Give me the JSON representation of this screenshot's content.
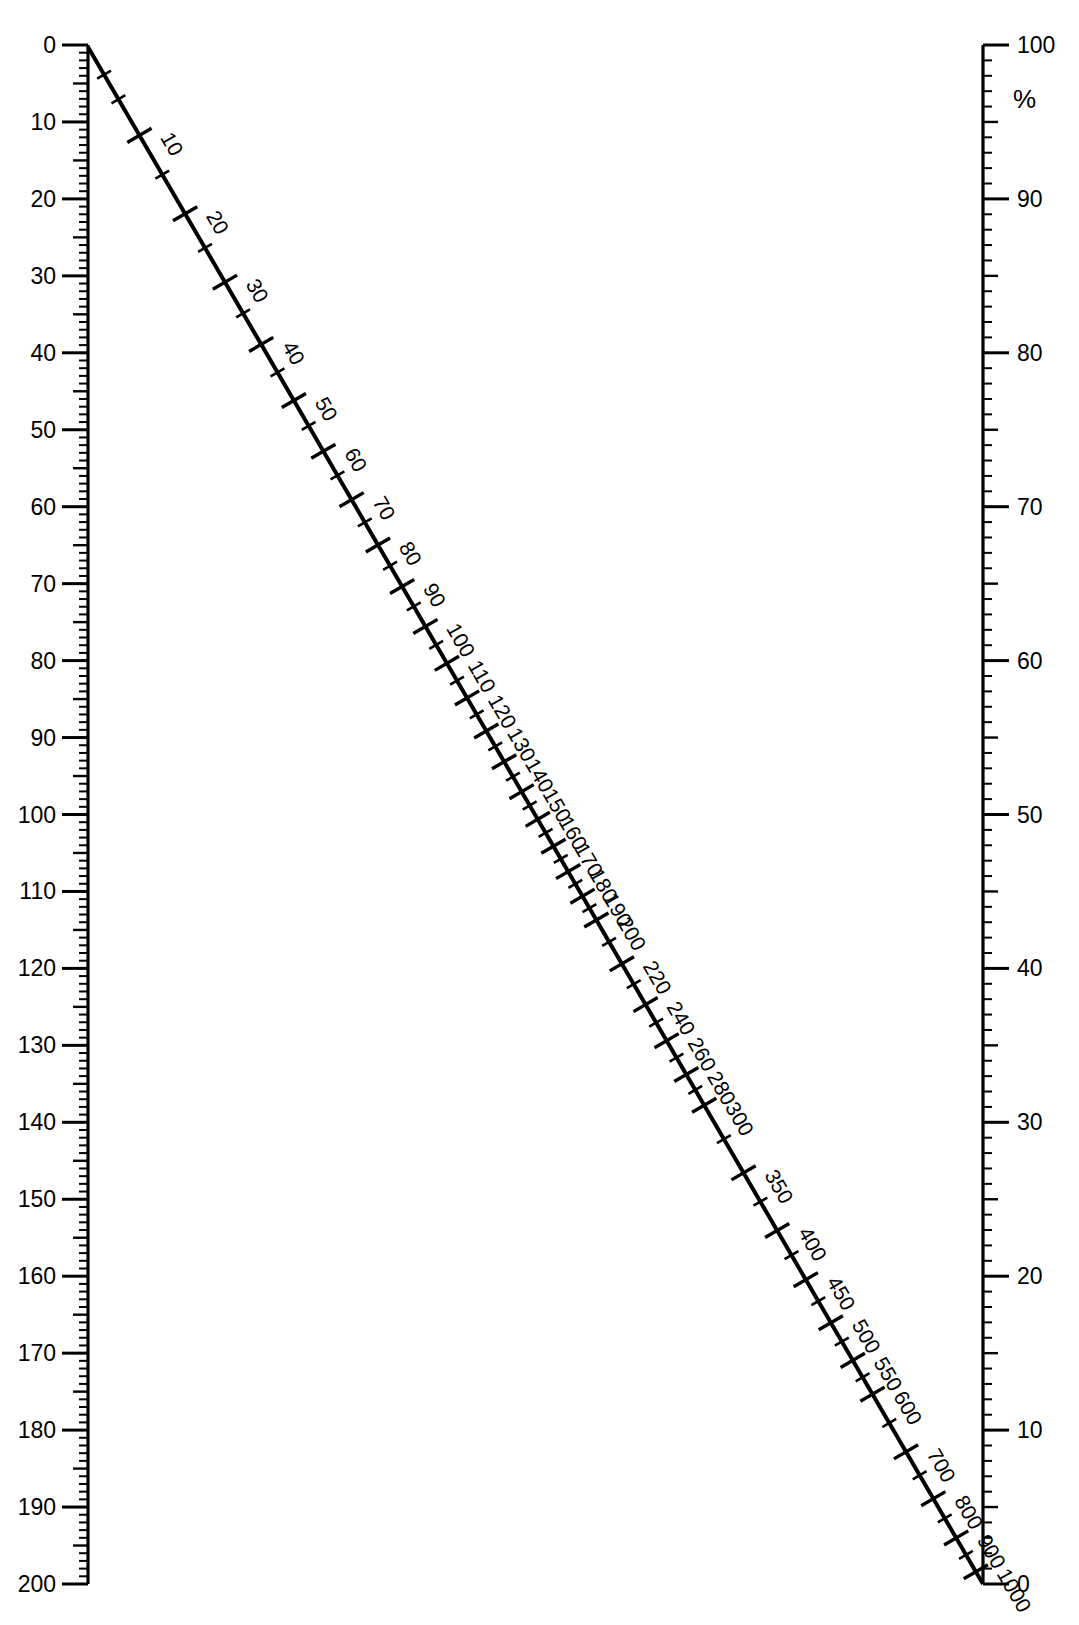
{
  "figure": {
    "type": "nomogram",
    "title_fragment": "",
    "background": "#ffffff",
    "ink_color": "#000000"
  },
  "chart_data": {
    "type": "line",
    "title": "",
    "subtitle": "",
    "xlabel": "",
    "ylabel": "",
    "grid": false,
    "legend": "none",
    "axes": [
      {
        "name": "left-axis",
        "position": "left",
        "orientation": "vertical",
        "direction": "top-to-bottom",
        "range": [
          0,
          200
        ],
        "min": 0,
        "max": 200,
        "major_step": 10,
        "medium_step": 5,
        "minor_step": 1,
        "unit": "",
        "tick_side": "left",
        "major_ticks": [
          0,
          10,
          20,
          30,
          40,
          50,
          60,
          70,
          80,
          90,
          100,
          110,
          120,
          130,
          140,
          150,
          160,
          170,
          180,
          190,
          200
        ],
        "tick_labels": [
          "0",
          "10",
          "20",
          "30",
          "40",
          "50",
          "60",
          "70",
          "80",
          "90",
          "100",
          "110",
          "120",
          "130",
          "140",
          "150",
          "160",
          "170",
          "180",
          "190",
          "200"
        ]
      },
      {
        "name": "right-axis",
        "position": "right",
        "orientation": "vertical",
        "direction": "top-to-bottom",
        "range": [
          100,
          0
        ],
        "min": 0,
        "max": 100,
        "major_step": 10,
        "medium_step": 5,
        "minor_step": 1,
        "unit": "%",
        "unit_label": "%",
        "tick_side": "right",
        "major_ticks": [
          100,
          90,
          80,
          70,
          60,
          50,
          40,
          30,
          20,
          10,
          0
        ],
        "tick_labels": [
          "100",
          "90",
          "80",
          "70",
          "60",
          "50",
          "40",
          "30",
          "20",
          "10",
          "0"
        ]
      }
    ],
    "series": [
      {
        "name": "diagonal-scale-line",
        "kind": "straight-line-with-scale",
        "from": {
          "left_axis_value": 0,
          "right_axis_value": 100
        },
        "to": {
          "left_axis_value": 200,
          "right_axis_value": 0
        },
        "scale_min": 10,
        "scale_max": 1000,
        "labeled_ticks": [
          "10",
          "20",
          "30",
          "40",
          "50",
          "60",
          "70",
          "80",
          "90",
          "100",
          "110",
          "120",
          "130",
          "140",
          "150",
          "160",
          "170",
          "180",
          "190",
          "200",
          "220",
          "240",
          "260",
          "280",
          "300",
          "350",
          "400",
          "450",
          "500",
          "550",
          "600",
          "700",
          "800",
          "900",
          "1000"
        ],
        "minor_ticks_present": true,
        "minor_tick_note": "short unlabelled ticks fall midway between labelled ticks",
        "label_orientation": "rotated-with-line"
      }
    ]
  },
  "annotations": {
    "percent_symbol": "%"
  }
}
